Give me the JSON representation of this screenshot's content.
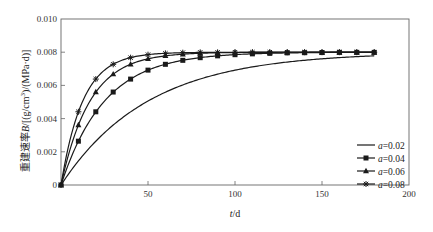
{
  "chart_data": {
    "type": "line",
    "title": "",
    "xlabel": "t/d",
    "ylabel": "重建速率B/[(g/cm³)/(MPa·d)]",
    "xlim": [
      0,
      200
    ],
    "ylim": [
      0,
      0.01
    ],
    "xticks": [
      50,
      100,
      150,
      200
    ],
    "xtick_labels": [
      "50",
      "100",
      "150",
      "200"
    ],
    "yticks": [
      0,
      0.002,
      0.004,
      0.006,
      0.008,
      0.01
    ],
    "ytick_labels": [
      "0",
      "0.002",
      "0.004",
      "0.006",
      "0.008",
      "0.010"
    ],
    "grid": false,
    "legend_position": "lower right",
    "model": "B = 0.008 * (1 - exp(-a*t))",
    "x": [
      0,
      10,
      20,
      30,
      40,
      50,
      60,
      70,
      80,
      90,
      100,
      110,
      120,
      130,
      140,
      150,
      160,
      170,
      180
    ],
    "series": [
      {
        "name": "a=0.02",
        "marker": "none",
        "values": [
          0,
          0.00145,
          0.00264,
          0.00361,
          0.00441,
          0.00506,
          0.0056,
          0.00603,
          0.00638,
          0.00668,
          0.00692,
          0.00711,
          0.00727,
          0.0074,
          0.00751,
          0.0076,
          0.00767,
          0.00773,
          0.00778
        ]
      },
      {
        "name": "a=0.04",
        "marker": "square",
        "values": [
          0,
          0.00264,
          0.00441,
          0.0056,
          0.00638,
          0.00692,
          0.00727,
          0.00751,
          0.00767,
          0.00778,
          0.00785,
          0.0079,
          0.00793,
          0.00796,
          0.00797,
          0.00798,
          0.00799,
          0.00799,
          0.00799
        ]
      },
      {
        "name": "a=0.06",
        "marker": "triangle",
        "values": [
          0,
          0.00361,
          0.0056,
          0.00668,
          0.00727,
          0.0076,
          0.00778,
          0.00788,
          0.00793,
          0.00796,
          0.00798,
          0.00799,
          0.00799,
          0.008,
          0.008,
          0.008,
          0.008,
          0.008,
          0.008
        ]
      },
      {
        "name": "a=0.08",
        "marker": "star",
        "values": [
          0,
          0.00441,
          0.00638,
          0.00727,
          0.00767,
          0.00785,
          0.00793,
          0.00797,
          0.00799,
          0.00799,
          0.008,
          0.008,
          0.008,
          0.008,
          0.008,
          0.008,
          0.008,
          0.008,
          0.008
        ]
      }
    ]
  },
  "legend": {
    "items": [
      {
        "symbol": "a",
        "value": "=0.02"
      },
      {
        "symbol": "a",
        "value": "=0.04"
      },
      {
        "symbol": "a",
        "value": "=0.06"
      },
      {
        "symbol": "a",
        "value": "=0.08"
      }
    ]
  },
  "labels": {
    "xlabel_var": "t",
    "xlabel_unit": "/d",
    "ylabel_prefix": "重建速率",
    "ylabel_var": "B",
    "ylabel_unit": "/[(g/cm",
    "ylabel_sup": "3",
    "ylabel_tail": ")/(MPa·d)]"
  },
  "colors": {
    "line": "#1a1a1a",
    "frame": "#555555"
  }
}
